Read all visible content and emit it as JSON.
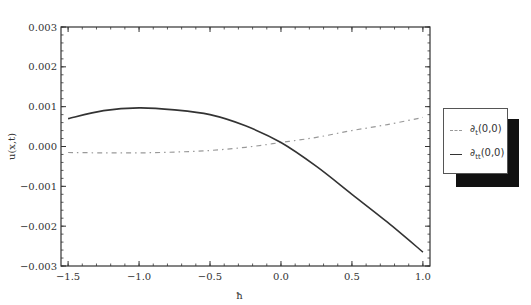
{
  "chart_data": {
    "type": "line",
    "title": "",
    "xlabel": "ħ",
    "ylabel": "u(x,t)",
    "xlim": [
      -1.55,
      1.05
    ],
    "ylim": [
      -0.003,
      0.003
    ],
    "x_ticks": [
      "-1.5",
      "-1.0",
      "-0.5",
      "0.0",
      "0.5",
      "1.0"
    ],
    "y_ticks": [
      "0.003",
      "0.002",
      "0.001",
      "0.000",
      "-0.001",
      "-0.002",
      "-0.003"
    ],
    "grid": false,
    "legend_position": "right",
    "series": [
      {
        "name": "∂t(0,0)",
        "style": "dash-dot",
        "color": "#999999",
        "x": [
          -1.5,
          -1.25,
          -1.0,
          -0.75,
          -0.5,
          -0.25,
          0.0,
          0.25,
          0.5,
          0.75,
          1.0
        ],
        "values": [
          -0.00015,
          -0.00016,
          -0.00016,
          -0.00014,
          -0.0001,
          -2e-05,
          0.0001,
          0.00023,
          0.0004,
          0.00055,
          0.00073
        ]
      },
      {
        "name": "∂tt(0,0)",
        "style": "solid",
        "color": "#333333",
        "x": [
          -1.5,
          -1.25,
          -1.0,
          -0.75,
          -0.5,
          -0.25,
          0.0,
          0.25,
          0.5,
          0.75,
          1.0
        ],
        "values": [
          0.0007,
          0.0009,
          0.00097,
          0.00092,
          0.0008,
          0.00052,
          0.0001,
          -0.0005,
          -0.0012,
          -0.0019,
          -0.00265
        ]
      }
    ]
  },
  "legend": {
    "items": [
      {
        "label_main": "∂",
        "label_sub": "t",
        "label_tail": "(0,0)"
      },
      {
        "label_main": "∂",
        "label_sub": "tt",
        "label_tail": "(0,0)"
      }
    ]
  }
}
